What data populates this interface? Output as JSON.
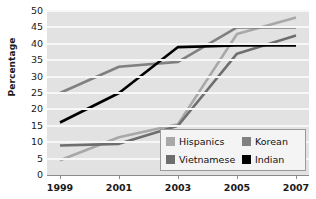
{
  "chart_data": {
    "type": "line",
    "title": "",
    "xlabel": "",
    "ylabel": "Percentage",
    "x": [
      1999,
      2001,
      2003,
      2005,
      2007
    ],
    "categories": [
      "1999",
      "2001",
      "2003",
      "2005",
      "2007"
    ],
    "ylim": [
      0,
      50
    ],
    "ytick_labels": [
      "0",
      "5",
      "10",
      "15",
      "20",
      "25",
      "30",
      "35",
      "40",
      "45",
      "50"
    ],
    "ytick_values": [
      0,
      5,
      10,
      15,
      20,
      25,
      30,
      35,
      40,
      45,
      50
    ],
    "grid": "horizontal",
    "legend_position": "lower-right",
    "series": [
      {
        "name": "Hispanics",
        "color": "#a8a8a8",
        "values": [
          4.5,
          11.5,
          15.5,
          43,
          48
        ]
      },
      {
        "name": "Vietnamese",
        "color": "#6e6e6e",
        "values": [
          9,
          9.5,
          15,
          37,
          42.5
        ]
      },
      {
        "name": "Korean",
        "color": "#808080",
        "values": [
          25,
          33,
          34.5,
          45,
          45
        ]
      },
      {
        "name": "Indian",
        "color": "#000000",
        "values": [
          16,
          25,
          39,
          39.5,
          39.5
        ]
      }
    ]
  },
  "legend": {
    "items": [
      {
        "label": "Hispanics",
        "color": "#a8a8a8"
      },
      {
        "label": "Korean",
        "color": "#808080"
      },
      {
        "label": "Vietnamese",
        "color": "#6e6e6e"
      },
      {
        "label": "Indian",
        "color": "#000000"
      }
    ]
  },
  "style": {
    "plot_background": "#e2e2e2",
    "gridline_color": "#f7f7f7",
    "axis_color": "#8a8a8a",
    "text_color": "#1a1a1a"
  }
}
